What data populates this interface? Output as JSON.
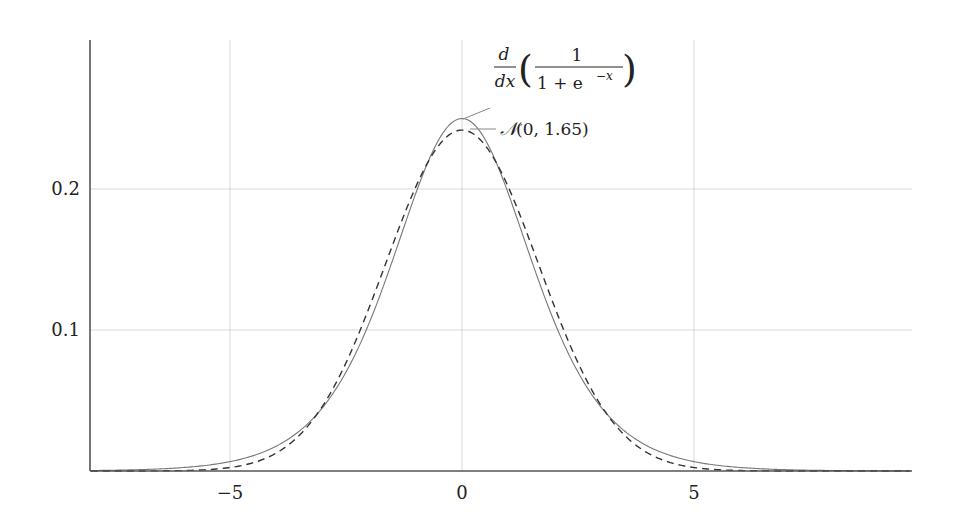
{
  "chart_data": {
    "type": "line",
    "title": "",
    "xlabel": "",
    "ylabel": "",
    "xlim": [
      -8,
      9.65
    ],
    "ylim": [
      0,
      0.3
    ],
    "grid": true,
    "legend_position": "annotations near peak",
    "x_ticks": [
      -5,
      0,
      5
    ],
    "x_tick_labels": [
      "−5",
      "0",
      "5"
    ],
    "y_ticks": [
      0.1,
      0.2
    ],
    "y_tick_labels": [
      "0.1",
      "0.2"
    ],
    "series": [
      {
        "name": "d/dx (1/(1+e^-x))",
        "style": "solid",
        "function": "logistic_derivative",
        "x": [
          -8,
          -6,
          -5,
          -4,
          -3,
          -2,
          -1,
          0,
          1,
          2,
          3,
          4,
          5,
          6,
          8,
          9.65
        ],
        "values": [
          0.0003,
          0.0025,
          0.0066,
          0.0177,
          0.0452,
          0.105,
          0.1966,
          0.25,
          0.1966,
          0.105,
          0.0452,
          0.0177,
          0.0066,
          0.0025,
          0.0003,
          0.0001
        ]
      },
      {
        "name": "N(0, 1.65)",
        "style": "dashed",
        "function": "normal_pdf",
        "sigma": 1.65,
        "x": [
          -8,
          -6,
          -5,
          -4,
          -3,
          -2,
          -1,
          0,
          1,
          2,
          3,
          4,
          5,
          6,
          8,
          9.65
        ],
        "values": [
          0.0,
          0.0001,
          0.0025,
          0.0128,
          0.0463,
          0.1157,
          0.2004,
          0.2418,
          0.2004,
          0.1157,
          0.0463,
          0.0128,
          0.0025,
          0.0001,
          0.0,
          0.0
        ]
      }
    ],
    "annotations": [
      {
        "target_series": 0,
        "text": "d/dx ( 1 / (1 + e^−x) )",
        "parts": {
          "deriv_num": "d",
          "deriv_den": "dx",
          "frac_num": "1",
          "frac_den_a": "1 + e",
          "frac_den_exp": "−x"
        }
      },
      {
        "target_series": 1,
        "text": "𝒩(0, 1.65)",
        "parts": {
          "symbol": "𝒩",
          "args": "(0, 1.65)"
        }
      }
    ]
  },
  "style": {
    "axis_color": "#555555",
    "grid_color": "#cfcfcf",
    "curve_color": "#777777",
    "dashed_color": "#333333"
  }
}
